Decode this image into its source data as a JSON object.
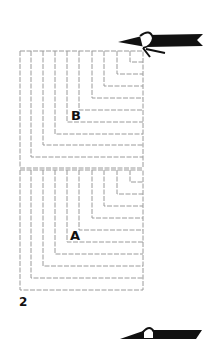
{
  "figure": {
    "number_label": "2",
    "panel_labels": {
      "upper": "B",
      "lower": "A"
    },
    "panels": [
      {
        "name": "upper",
        "right_x": 143,
        "top_y": 51,
        "verticals_x": [
          20,
          31,
          43,
          55,
          67,
          79,
          92,
          104,
          117,
          130
        ],
        "bottoms_y": [
          168,
          157,
          145,
          134,
          122,
          110,
          98,
          86,
          74,
          62
        ]
      },
      {
        "name": "lower",
        "right_x": 143,
        "top_y": 170,
        "verticals_x": [
          20,
          31,
          43,
          55,
          67,
          79,
          92,
          104,
          117,
          130
        ],
        "bottoms_y": [
          290,
          278,
          266,
          254,
          242,
          230,
          218,
          206,
          194,
          182
        ]
      }
    ],
    "line_color": "#9a9a9a",
    "pencil_color": "#111111",
    "icons": [
      "pencil-icon-top",
      "pencil-icon-bottom"
    ]
  }
}
